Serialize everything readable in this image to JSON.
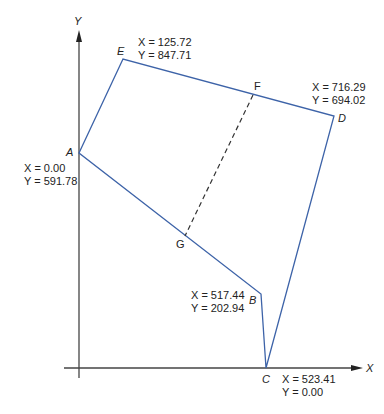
{
  "diagram": {
    "colors": {
      "polygon": "#3d63a8",
      "axes": "#444444",
      "dashed": "#333333",
      "text": "#222222"
    },
    "axes": {
      "x_label": "X",
      "y_label": "Y"
    },
    "vertices": {
      "A": {
        "label": "A",
        "x_text": "X = 0.00",
        "y_text": "Y = 591.78"
      },
      "B": {
        "label": "B",
        "x_text": "X = 517.44",
        "y_text": "Y = 202.94"
      },
      "C": {
        "label": "C",
        "x_text": "X = 523.41",
        "y_text": "Y = 0.00"
      },
      "D": {
        "label": "D",
        "x_text": "X = 716.29",
        "y_text": "Y = 694.02"
      },
      "E": {
        "label": "E",
        "x_text": "X = 125.72",
        "y_text": "Y = 847.71"
      }
    },
    "division_points": {
      "F": {
        "label": "F"
      },
      "G": {
        "label": "G"
      }
    },
    "polygon_order": [
      "A",
      "E",
      "D",
      "C",
      "B"
    ],
    "dashed_line": [
      "F",
      "G"
    ]
  }
}
